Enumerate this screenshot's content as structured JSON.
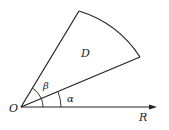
{
  "diagram": {
    "type": "polar-sector",
    "labels": {
      "origin": "O",
      "region": "D",
      "axis": "R",
      "angle_alpha": "α",
      "angle_beta": "β"
    },
    "colors": {
      "stroke": "#222222",
      "background": "#ffffff"
    }
  }
}
